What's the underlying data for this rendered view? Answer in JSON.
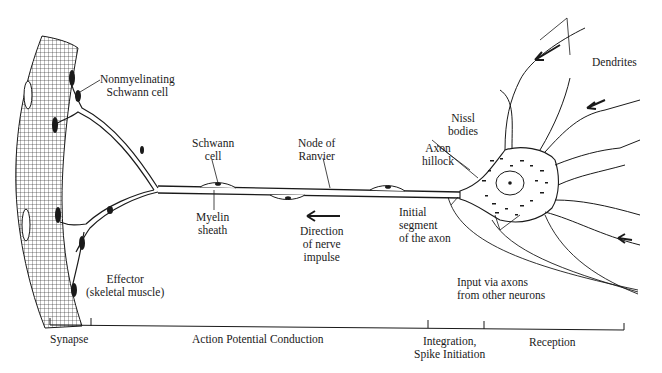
{
  "diagram": {
    "type": "neuron-anatomy",
    "labels": {
      "nonmyelinating_schwann": [
        "Nonmyelinating",
        "Schwann cell"
      ],
      "schwann_cell": [
        "Schwann",
        "cell"
      ],
      "node_of_ranvier": [
        "Node of",
        "Ranvier"
      ],
      "myelin_sheath": [
        "Myelin",
        "sheath"
      ],
      "direction": [
        "Direction",
        "of nerve",
        "impulse"
      ],
      "effector": [
        "Effector",
        "(skeletal muscle)"
      ],
      "axon_hillock": [
        "Axon",
        "hillock"
      ],
      "nissl_bodies": [
        "Nissl",
        "bodies"
      ],
      "initial_segment": [
        "Initial",
        "segment",
        "of the axon"
      ],
      "dendrites": "Dendrites",
      "input_axons": [
        "Input via axons",
        "from other neurons"
      ]
    },
    "scale_bar": {
      "segments": [
        {
          "label": "Synapse",
          "x_start": 50,
          "x_end": 91
        },
        {
          "label": "Action Potential Conduction",
          "x_start": 91,
          "x_end": 428
        },
        {
          "label_lines": [
            "Integration,",
            "Spike Initiation"
          ],
          "x_start": 428,
          "x_end": 484
        },
        {
          "label": "Reception",
          "x_start": 484,
          "x_end": 624
        }
      ]
    },
    "colors": {
      "ink": "#1a1a1a",
      "background": "#ffffff"
    }
  }
}
